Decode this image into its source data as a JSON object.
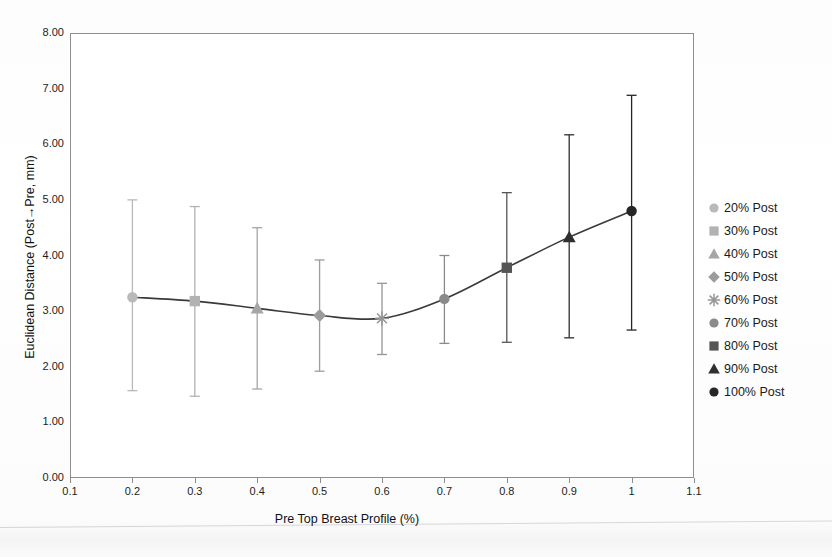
{
  "chart_data": {
    "type": "line",
    "title": "",
    "xlabel": "Pre Top Breast Profile (%)",
    "ylabel": "Euclidean Distance (Post→Pre, mm)",
    "xlim": [
      0.1,
      1.1
    ],
    "ylim": [
      0.0,
      8.0
    ],
    "grid": false,
    "legend_position": "right",
    "x_tick_labels": [
      "0.1",
      "0.2",
      "0.3",
      "0.4",
      "0.5",
      "0.6",
      "0.7",
      "0.8",
      "0.9",
      "1",
      "1.1"
    ],
    "x_tick_values": [
      0.1,
      0.2,
      0.3,
      0.4,
      0.5,
      0.6,
      0.7,
      0.8,
      0.9,
      1.0,
      1.1
    ],
    "y_tick_labels": [
      "0.00",
      "1.00",
      "2.00",
      "3.00",
      "4.00",
      "5.00",
      "6.00",
      "7.00",
      "8.00"
    ],
    "y_tick_values": [
      0,
      1,
      2,
      3,
      4,
      5,
      6,
      7,
      8
    ],
    "x": [
      0.2,
      0.3,
      0.4,
      0.5,
      0.6,
      0.7,
      0.8,
      0.9,
      1.0
    ],
    "values": [
      3.25,
      3.18,
      3.05,
      2.92,
      2.87,
      3.22,
      3.78,
      4.33,
      4.8
    ],
    "error_upper": [
      5.0,
      4.88,
      4.5,
      3.92,
      3.5,
      4.0,
      5.13,
      6.17,
      6.88
    ],
    "error_lower": [
      1.57,
      1.47,
      1.6,
      1.92,
      2.22,
      2.42,
      2.44,
      2.52,
      2.66
    ],
    "points": [
      {
        "label": "20% Post",
        "x": 0.2,
        "y": 3.25,
        "err_hi": 5.0,
        "err_lo": 1.57,
        "marker": "circle",
        "color": "#b9b9b9"
      },
      {
        "label": "30% Post",
        "x": 0.3,
        "y": 3.18,
        "err_hi": 4.88,
        "err_lo": 1.47,
        "marker": "square",
        "color": "#b2b2b2"
      },
      {
        "label": "40% Post",
        "x": 0.4,
        "y": 3.05,
        "err_hi": 4.5,
        "err_lo": 1.6,
        "marker": "triangle",
        "color": "#a6a6a6"
      },
      {
        "label": "50% Post",
        "x": 0.5,
        "y": 2.92,
        "err_hi": 3.92,
        "err_lo": 1.92,
        "marker": "diamond",
        "color": "#9c9c9c"
      },
      {
        "label": "60% Post",
        "x": 0.6,
        "y": 2.87,
        "err_hi": 3.5,
        "err_lo": 2.22,
        "marker": "star",
        "color": "#959595"
      },
      {
        "label": "70% Post",
        "x": 0.7,
        "y": 3.22,
        "err_hi": 4.0,
        "err_lo": 2.42,
        "marker": "circle",
        "color": "#8a8a8a"
      },
      {
        "label": "80% Post",
        "x": 0.8,
        "y": 3.78,
        "err_hi": 5.13,
        "err_lo": 2.44,
        "marker": "square",
        "color": "#555555"
      },
      {
        "label": "90% Post",
        "x": 0.9,
        "y": 4.33,
        "err_hi": 6.17,
        "err_lo": 2.52,
        "marker": "triangle",
        "color": "#2f2f2f"
      },
      {
        "label": "100% Post",
        "x": 1.0,
        "y": 4.8,
        "err_hi": 6.88,
        "err_lo": 2.66,
        "marker": "circle",
        "color": "#262626"
      }
    ],
    "line_color": "#3a3a3a",
    "axis_color": "#8e8e8e",
    "errorbar_color": "#7d7d7d"
  },
  "legend": {
    "items": [
      {
        "label": "20% Post",
        "marker": "circle",
        "color": "#b9b9b9"
      },
      {
        "label": "30% Post",
        "marker": "square",
        "color": "#b2b2b2"
      },
      {
        "label": "40% Post",
        "marker": "triangle",
        "color": "#a6a6a6"
      },
      {
        "label": "50% Post",
        "marker": "diamond",
        "color": "#9c9c9c"
      },
      {
        "label": "60% Post",
        "marker": "star",
        "color": "#959595"
      },
      {
        "label": "70% Post",
        "marker": "circle",
        "color": "#8a8a8a"
      },
      {
        "label": "80% Post",
        "marker": "square",
        "color": "#555555"
      },
      {
        "label": "90% Post",
        "marker": "triangle",
        "color": "#2f2f2f"
      },
      {
        "label": "100% Post",
        "marker": "circle",
        "color": "#262626"
      }
    ]
  }
}
